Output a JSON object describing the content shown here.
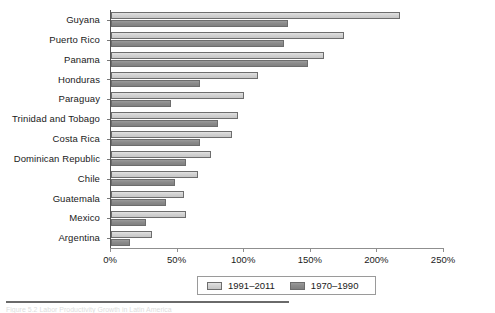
{
  "figure": {
    "caption": "Figure 5.2 Labor Productivity Growth in Latin America",
    "caption_visible": false
  },
  "legend": {
    "position": "bottom-center",
    "entries": [
      {
        "label": "1991–2011",
        "key": "recent",
        "color": "#d2d2d2"
      },
      {
        "label": "1970–1990",
        "key": "early",
        "color": "#8b8b8b"
      }
    ]
  },
  "axis": {
    "x_ticks": [
      "0%",
      "50%",
      "100%",
      "150%",
      "200%",
      "250%"
    ],
    "x_min": 0,
    "x_max": 250
  },
  "chart_data": {
    "type": "bar",
    "orientation": "horizontal",
    "title": "",
    "xlabel": "",
    "ylabel": "",
    "xlim": [
      0,
      250
    ],
    "grid": false,
    "legend_position": "bottom-center",
    "tick_labels": [
      "0%",
      "50%",
      "100%",
      "150%",
      "200%",
      "250%"
    ],
    "categories": [
      "Guyana",
      "Puerto Rico",
      "Panama",
      "Honduras",
      "Paraguay",
      "Trinidad and Tobago",
      "Costa Rica",
      "Dominican Republic",
      "Chile",
      "Guatemala",
      "Mexico",
      "Argentina"
    ],
    "series": [
      {
        "name": "1991–2011",
        "key": "recent",
        "color": "#d2d2d2",
        "values": [
          217,
          175,
          160,
          110,
          100,
          95,
          91,
          75,
          65,
          55,
          56,
          31
        ]
      },
      {
        "name": "1970–1990",
        "key": "early",
        "color": "#8b8b8b",
        "values": [
          133,
          130,
          148,
          67,
          45,
          80,
          67,
          56,
          48,
          41,
          26,
          14
        ]
      }
    ]
  }
}
